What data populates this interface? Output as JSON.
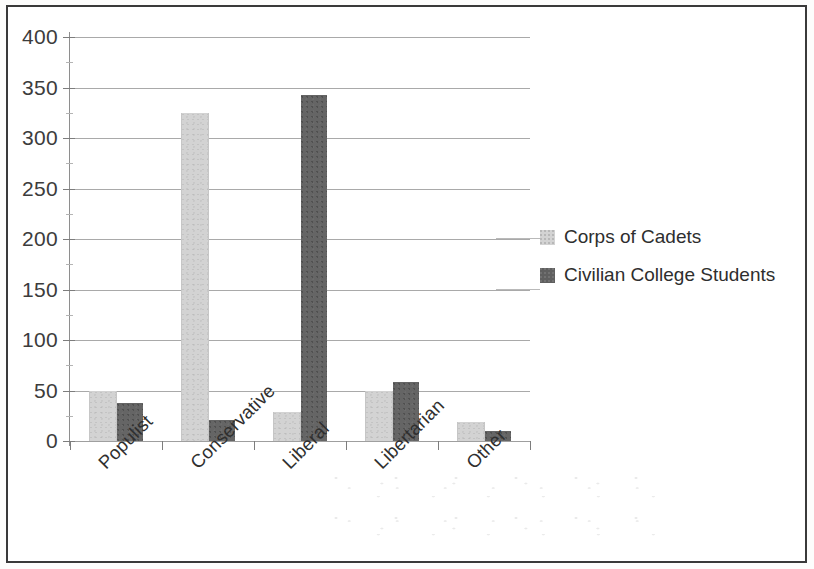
{
  "chart_data": {
    "type": "bar",
    "title": "",
    "xlabel": "",
    "ylabel": "",
    "categories": [
      "Populist",
      "Conservative",
      "Liberal",
      "Libertarian",
      "Other"
    ],
    "series": [
      {
        "name": "Corps of Cadets",
        "color": "#d3d3d3",
        "values": [
          50,
          325,
          29,
          50,
          19
        ]
      },
      {
        "name": "Civilian College Students",
        "color": "#656565",
        "values": [
          38,
          21,
          343,
          58,
          10
        ]
      }
    ],
    "ylim": [
      0,
      400
    ],
    "ytick_values": [
      0,
      50,
      100,
      150,
      200,
      250,
      300,
      350,
      400
    ],
    "ytick_labels": [
      "0",
      "50",
      "100",
      "150",
      "200",
      "250",
      "300",
      "350",
      "400"
    ],
    "grid": true,
    "legend_position": "right"
  },
  "legend": {
    "entries": [
      {
        "label": "Corps of Cadets",
        "swatch": "corps"
      },
      {
        "label": "Civilian College Students",
        "swatch": "civilian"
      }
    ]
  }
}
